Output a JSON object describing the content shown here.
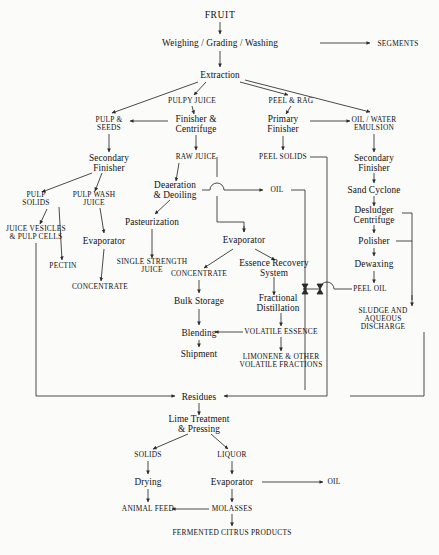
{
  "diagram": {
    "line_color": "#2b2b2b",
    "text_color": "#111111",
    "background": "#fbfbfa"
  },
  "nodes": {
    "fruit": {
      "label": "FRUIT",
      "x": 220,
      "y": 15,
      "kind": "material"
    },
    "weighing": {
      "label": "Weighing / Grading / Washing",
      "x": 220,
      "y": 43,
      "kind": "process"
    },
    "segments": {
      "label": "SEGMENTS",
      "x": 398,
      "y": 44,
      "kind": "material"
    },
    "extraction": {
      "label": "Extraction",
      "x": 220,
      "y": 75,
      "kind": "process"
    },
    "pulpy_juice": {
      "label": "PULPY JUICE",
      "x": 192,
      "y": 101,
      "kind": "material"
    },
    "peel_rag": {
      "label": "PEEL & RAG",
      "x": 291,
      "y": 101,
      "kind": "material"
    },
    "pulp_seeds": {
      "label": "PULP &\nSEEDS",
      "x": 109,
      "y": 124,
      "kind": "material"
    },
    "finisher_centrifuge": {
      "label": "Finisher &\nCentrifuge",
      "x": 196,
      "y": 124,
      "kind": "process"
    },
    "primary_finisher": {
      "label": "Primary\nFinisher",
      "x": 283,
      "y": 124,
      "kind": "process"
    },
    "oil_water_emulsion": {
      "label": "OIL / WATER\nEMULSION",
      "x": 374,
      "y": 124,
      "kind": "material"
    },
    "secondary_finisher_left": {
      "label": "Secondary\nFinisher",
      "x": 109,
      "y": 163,
      "kind": "process"
    },
    "raw_juice": {
      "label": "RAW JUICE",
      "x": 196,
      "y": 157,
      "kind": "material"
    },
    "peel_solids": {
      "label": "PEEL SOLIDS",
      "x": 283,
      "y": 157,
      "kind": "material"
    },
    "secondary_finisher_right": {
      "label": "Secondary\nFinisher",
      "x": 374,
      "y": 163,
      "kind": "process"
    },
    "pulp_solids": {
      "label": "PULP\nSOLIDS",
      "x": 36,
      "y": 199,
      "kind": "material"
    },
    "pulp_wash_juice": {
      "label": "PULP WASH\nJUICE",
      "x": 94,
      "y": 199,
      "kind": "material"
    },
    "deaeration": {
      "label": "Deaeration\n& Deoiling",
      "x": 175,
      "y": 190,
      "kind": "process"
    },
    "oil_mid": {
      "label": "OIL",
      "x": 277,
      "y": 190,
      "kind": "material"
    },
    "sand_cyclone": {
      "label": "Sand Cyclone",
      "x": 374,
      "y": 190,
      "kind": "process"
    },
    "juice_vesicles": {
      "label": "JUICE VESICLES\n& PULP CELLS",
      "x": 36,
      "y": 233,
      "kind": "material"
    },
    "pasteurization": {
      "label": "Pasteurization",
      "x": 152,
      "y": 222,
      "kind": "process"
    },
    "desludger": {
      "label": "Desludger\nCentrifuge",
      "x": 374,
      "y": 215,
      "kind": "process"
    },
    "evaporator_left": {
      "label": "Evaporator",
      "x": 104,
      "y": 241,
      "kind": "process"
    },
    "evaporator_mid": {
      "label": "Evaporator",
      "x": 244,
      "y": 240,
      "kind": "process"
    },
    "polisher": {
      "label": "Polisher",
      "x": 374,
      "y": 241,
      "kind": "process"
    },
    "pectin": {
      "label": "PECTIN",
      "x": 63,
      "y": 266,
      "kind": "material"
    },
    "single_strength_juice": {
      "label": "SINGLE STRENGTH\nJUICE",
      "x": 152,
      "y": 266,
      "kind": "material"
    },
    "concentrate_mid": {
      "label": "CONCENTRATE",
      "x": 199,
      "y": 274,
      "kind": "material"
    },
    "essence_recovery": {
      "label": "Essence Recovery\nSystem",
      "x": 274,
      "y": 268,
      "kind": "process"
    },
    "dewaxing": {
      "label": "Dewaxing",
      "x": 374,
      "y": 264,
      "kind": "process"
    },
    "concentrate_left": {
      "label": "CONCENTRATE",
      "x": 100,
      "y": 287,
      "kind": "material"
    },
    "peel_oil": {
      "label": "PEEL OIL",
      "x": 370,
      "y": 289,
      "kind": "material"
    },
    "bulk_storage": {
      "label": "Bulk Storage",
      "x": 199,
      "y": 301,
      "kind": "process"
    },
    "fractional_distillation": {
      "label": "Fractional\nDistillation",
      "x": 278,
      "y": 303,
      "kind": "process"
    },
    "sludge_discharge": {
      "label": "SLUDGE AND\nAQUEOUS DISCHARGE",
      "x": 383,
      "y": 319,
      "kind": "material"
    },
    "blending": {
      "label": "Blending",
      "x": 199,
      "y": 333,
      "kind": "process"
    },
    "volatile_essence": {
      "label": "VOLATILE ESSENCE",
      "x": 281,
      "y": 332,
      "kind": "material"
    },
    "shipment": {
      "label": "Shipment",
      "x": 199,
      "y": 354,
      "kind": "process"
    },
    "limonene": {
      "label": "LIMONENE & OTHER\nVOLATILE FRACTIONS",
      "x": 281,
      "y": 361,
      "kind": "material"
    },
    "residues": {
      "label": "Residues",
      "x": 199,
      "y": 397,
      "kind": "process"
    },
    "lime_treatment": {
      "label": "Lime Treatment\n& Pressing",
      "x": 199,
      "y": 424,
      "kind": "process"
    },
    "solids": {
      "label": "SOLIDS",
      "x": 148,
      "y": 455,
      "kind": "material"
    },
    "liquor": {
      "label": "LIQUOR",
      "x": 232,
      "y": 455,
      "kind": "material"
    },
    "drying": {
      "label": "Drying",
      "x": 148,
      "y": 482,
      "kind": "process"
    },
    "evaporator_bottom": {
      "label": "Evaporator",
      "x": 232,
      "y": 482,
      "kind": "process"
    },
    "oil_bottom": {
      "label": "OIL",
      "x": 334,
      "y": 482,
      "kind": "material"
    },
    "animal_feed": {
      "label": "ANIMAL FEED",
      "x": 148,
      "y": 509,
      "kind": "material"
    },
    "molasses": {
      "label": "MOLASSES",
      "x": 232,
      "y": 509,
      "kind": "material"
    },
    "fermented": {
      "label": "FERMENTED CITRUS PRODUCTS",
      "x": 232,
      "y": 533,
      "kind": "material"
    }
  },
  "edges": [
    {
      "from": "fruit",
      "to": "weighing"
    },
    {
      "from": "weighing",
      "to": "segments"
    },
    {
      "from": "weighing",
      "to": "extraction"
    },
    {
      "from": "extraction",
      "to": "pulpy_juice"
    },
    {
      "from": "extraction",
      "to": "peel_rag"
    },
    {
      "from": "extraction",
      "to": "oil_water_emulsion"
    },
    {
      "from": "pulpy_juice",
      "to": "finisher_centrifuge"
    },
    {
      "from": "finisher_centrifuge",
      "to": "pulp_seeds"
    },
    {
      "from": "peel_rag",
      "to": "primary_finisher"
    },
    {
      "from": "primary_finisher",
      "to": "oil_water_emulsion"
    },
    {
      "from": "primary_finisher",
      "to": "peel_solids"
    },
    {
      "from": "pulp_seeds",
      "to": "secondary_finisher_left"
    },
    {
      "from": "finisher_centrifuge",
      "to": "raw_juice"
    },
    {
      "from": "raw_juice",
      "to": "deaeration"
    },
    {
      "from": "secondary_finisher_left",
      "to": "pulp_solids"
    },
    {
      "from": "secondary_finisher_left",
      "to": "pulp_wash_juice"
    },
    {
      "from": "pulp_solids",
      "to": "juice_vesicles"
    },
    {
      "from": "pulp_solids",
      "to": "pectin"
    },
    {
      "from": "pulp_wash_juice",
      "to": "evaporator_left"
    },
    {
      "from": "evaporator_left",
      "to": "concentrate_left"
    },
    {
      "from": "deaeration",
      "to": "oil_mid"
    },
    {
      "from": "deaeration",
      "to": "pasteurization"
    },
    {
      "from": "pasteurization",
      "to": "single_strength_juice"
    },
    {
      "from": "raw_juice",
      "to": "evaporator_mid"
    },
    {
      "from": "evaporator_mid",
      "to": "concentrate_mid"
    },
    {
      "from": "evaporator_mid",
      "to": "essence_recovery"
    },
    {
      "from": "concentrate_mid",
      "to": "bulk_storage"
    },
    {
      "from": "bulk_storage",
      "to": "blending"
    },
    {
      "from": "blending",
      "to": "shipment"
    },
    {
      "from": "essence_recovery",
      "to": "fractional_distillation"
    },
    {
      "from": "fractional_distillation",
      "to": "volatile_essence"
    },
    {
      "from": "volatile_essence",
      "to": "blending"
    },
    {
      "from": "volatile_essence",
      "to": "limonene"
    },
    {
      "from": "oil_water_emulsion",
      "to": "secondary_finisher_right"
    },
    {
      "from": "secondary_finisher_right",
      "to": "sand_cyclone"
    },
    {
      "from": "sand_cyclone",
      "to": "desludger"
    },
    {
      "from": "desludger",
      "to": "polisher"
    },
    {
      "from": "polisher",
      "to": "dewaxing"
    },
    {
      "from": "dewaxing",
      "to": "peel_oil"
    },
    {
      "from": "peel_oil",
      "to": "essence_recovery"
    },
    {
      "from": "desludger",
      "to": "sludge_discharge"
    },
    {
      "from": "polisher",
      "to": "sludge_discharge"
    },
    {
      "from": "peel_solids",
      "to": "residues"
    },
    {
      "from": "oil_mid",
      "to": "residues"
    },
    {
      "from": "juice_vesicles",
      "to": "residues"
    },
    {
      "from": "sludge_discharge",
      "to": "residues"
    },
    {
      "from": "residues",
      "to": "lime_treatment"
    },
    {
      "from": "lime_treatment",
      "to": "solids"
    },
    {
      "from": "lime_treatment",
      "to": "liquor"
    },
    {
      "from": "solids",
      "to": "drying"
    },
    {
      "from": "liquor",
      "to": "evaporator_bottom"
    },
    {
      "from": "evaporator_bottom",
      "to": "oil_bottom"
    },
    {
      "from": "evaporator_bottom",
      "to": "molasses"
    },
    {
      "from": "drying",
      "to": "animal_feed"
    },
    {
      "from": "molasses",
      "to": "animal_feed"
    },
    {
      "from": "molasses",
      "to": "fermented"
    }
  ]
}
